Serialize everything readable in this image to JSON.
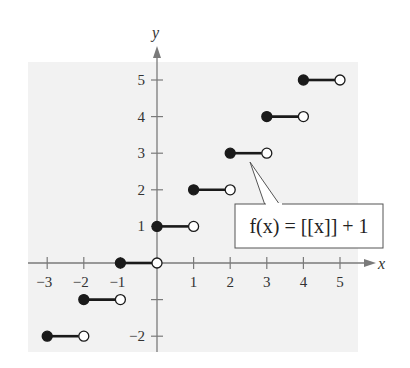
{
  "chart_data": {
    "type": "line",
    "title": "",
    "function_label": "f(x) = [[x]] + 1",
    "xlabel": "x",
    "ylabel": "y",
    "xlim": [
      -3.3,
      5.5
    ],
    "ylim": [
      -2.3,
      5.7
    ],
    "x_ticks": [
      -3,
      -2,
      -1,
      1,
      2,
      3,
      4,
      5
    ],
    "y_ticks": [
      -2,
      -1,
      1,
      2,
      3,
      4,
      5
    ],
    "x_tick_labels": [
      "−3",
      "−2",
      "−1",
      "1",
      "2",
      "3",
      "4",
      "5"
    ],
    "y_tick_labels": [
      "−2",
      "",
      "1",
      "2",
      "3",
      "4",
      "5"
    ],
    "grid": false,
    "legend": "none",
    "series": [
      {
        "name": "f(x) = [[x]] + 1",
        "style": "step",
        "segments": [
          {
            "x_start": -3,
            "x_end": -2,
            "y": -2,
            "start_closed": true,
            "end_closed": false
          },
          {
            "x_start": -2,
            "x_end": -1,
            "y": -1,
            "start_closed": true,
            "end_closed": false
          },
          {
            "x_start": -1,
            "x_end": 0,
            "y": 0,
            "start_closed": true,
            "end_closed": false
          },
          {
            "x_start": 0,
            "x_end": 1,
            "y": 1,
            "start_closed": true,
            "end_closed": false
          },
          {
            "x_start": 1,
            "x_end": 2,
            "y": 2,
            "start_closed": true,
            "end_closed": false
          },
          {
            "x_start": 2,
            "x_end": 3,
            "y": 3,
            "start_closed": true,
            "end_closed": false
          },
          {
            "x_start": 3,
            "x_end": 4,
            "y": 4,
            "start_closed": true,
            "end_closed": false
          },
          {
            "x_start": 4,
            "x_end": 5,
            "y": 5,
            "start_closed": true,
            "end_closed": false
          }
        ]
      }
    ],
    "annotations": [
      {
        "text": "f(x) = [[x]] + 1",
        "points_to_segment_y": 3
      }
    ]
  },
  "colors": {
    "plot_background": "#f2f2f2",
    "axis": "#7a7a7a",
    "segment": "#1a1a1a",
    "callout_border": "#555555"
  },
  "axes": {
    "x_label": "x",
    "y_label": "y"
  },
  "callout": {
    "text": "f(x) = [[x]] + 1"
  }
}
